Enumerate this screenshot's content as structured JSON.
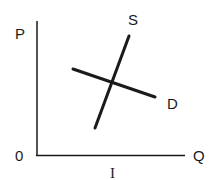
{
  "diagram": {
    "type": "supply-demand",
    "axes": {
      "y_label": "P",
      "x_label": "Q",
      "origin_label": "0",
      "x_tick_label": "I"
    },
    "curves": [
      {
        "name": "S",
        "label": "S",
        "from": [
          95,
          128
        ],
        "to": [
          129,
          36
        ]
      },
      {
        "name": "D",
        "label": "D",
        "from": [
          73,
          69
        ],
        "to": [
          155,
          97
        ]
      }
    ],
    "colors": {
      "line": "#1a1a1a",
      "background": "#ffffff"
    }
  }
}
